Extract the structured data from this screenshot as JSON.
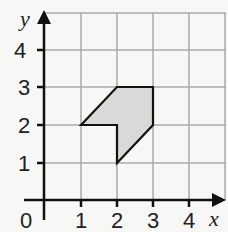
{
  "diagram": {
    "x_axis_label": "x",
    "y_axis_label": "y",
    "origin_label": "0",
    "x_ticks": [
      "1",
      "2",
      "3",
      "4"
    ],
    "y_ticks": [
      "1",
      "2",
      "3",
      "4"
    ],
    "shape": {
      "vertices": [
        [
          1,
          2
        ],
        [
          2,
          3
        ],
        [
          3,
          3
        ],
        [
          3,
          2
        ],
        [
          2,
          1
        ],
        [
          2,
          2
        ]
      ],
      "fill": "#d9d9d9",
      "stroke": "#111111"
    },
    "grid_color": "#aaaaaa"
  }
}
